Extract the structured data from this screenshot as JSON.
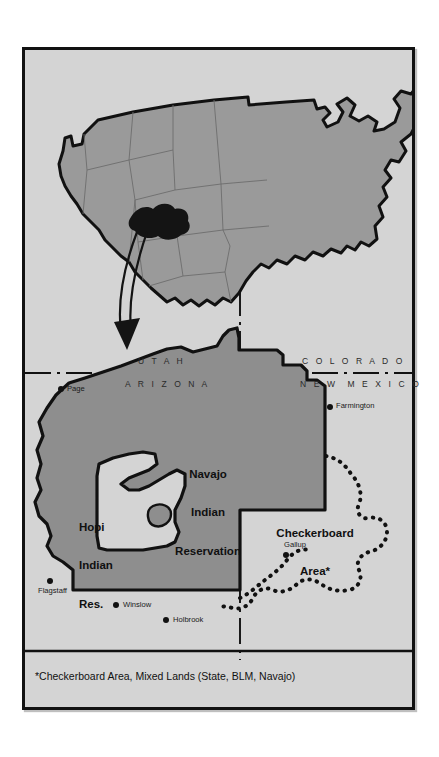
{
  "figure": {
    "kind": "map-figure",
    "background_color": "#d4d4d4",
    "frame_color": "#121212",
    "reservation_fill": "#8e8e8e",
    "hopi_fill": "#d4d4d4",
    "inset_fill": "#9a9a9a",
    "locator_blob_color": "#111111"
  },
  "inset": {
    "name": "united-states-locator-map",
    "highlight_label": "Navajo Nation location",
    "arrow": "curved-arrow-pointing-to-detail-map"
  },
  "detail_map": {
    "state_labels": [
      {
        "text": "U T A H",
        "x": 140,
        "y": 359
      },
      {
        "text": "A R I Z O N A",
        "x": 128,
        "y": 383
      },
      {
        "text": "C O L O R A D O",
        "x": 302,
        "y": 359
      },
      {
        "text": "N E W  M E X I C O",
        "x": 300,
        "y": 383
      }
    ],
    "area_labels": [
      {
        "text_lines": [
          "Navajo",
          "Indian",
          "Reservation"
        ],
        "x": 186,
        "y": 448,
        "align": "center"
      },
      {
        "text_lines": [
          "Hopi",
          "Indian",
          "Res."
        ],
        "x": 76,
        "y": 500,
        "align": "left"
      },
      {
        "text_lines": [
          "Checkerboard",
          "Area*"
        ],
        "x": 316,
        "y": 505,
        "align": "center"
      }
    ],
    "cities": [
      {
        "name": "Page",
        "dot_x": 58,
        "dot_y": 386,
        "label_x": 64,
        "label_y": 383
      },
      {
        "name": "Farmington",
        "dot_x": 327,
        "dot_y": 404,
        "label_x": 333,
        "label_y": 401
      },
      {
        "name": "Gallup",
        "dot_x": 283,
        "dot_y": 552,
        "label_x": 282,
        "label_y": 540
      },
      {
        "name": "Flagstaff",
        "dot_x": 47,
        "dot_y": 578,
        "label_x": 36,
        "label_y": 586
      },
      {
        "name": "Winslow",
        "dot_x": 113,
        "dot_y": 602,
        "label_x": 120,
        "label_y": 599
      },
      {
        "name": "Holbrook",
        "dot_x": 163,
        "dot_y": 617,
        "label_x": 170,
        "label_y": 614
      }
    ],
    "boundary_styles": {
      "state_line": "dash-dot",
      "reservation_line": "solid-thick-black",
      "checkerboard_line": "dotted-thick-black"
    }
  },
  "footnote": {
    "text": "*Checkerboard Area, Mixed Lands (State, BLM, Navajo)"
  }
}
